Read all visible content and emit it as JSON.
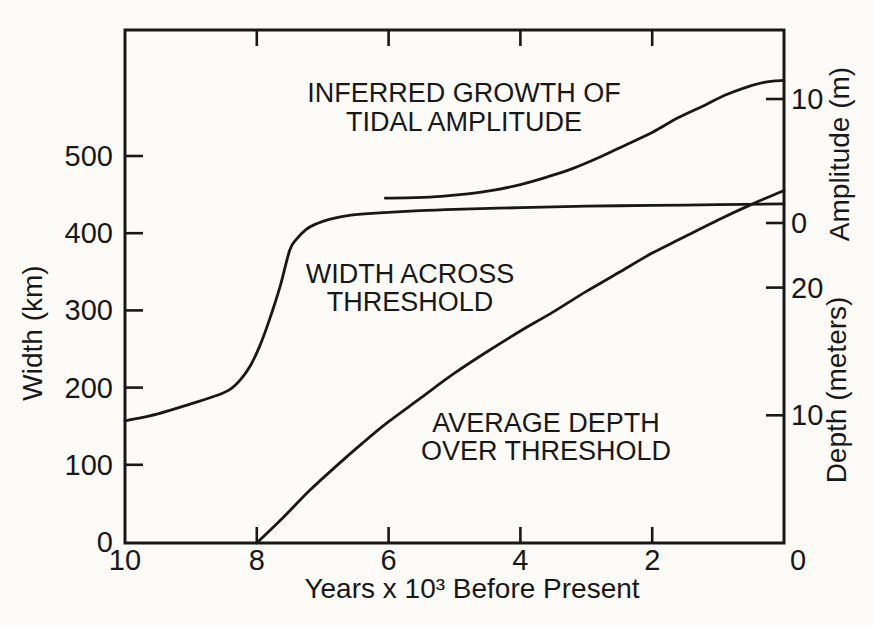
{
  "figure": {
    "background_color": "#fcfbf8",
    "ink_color": "#181818",
    "grid": false,
    "legend": "none"
  },
  "chart_data": {
    "type": "line",
    "title": "",
    "x_axis": {
      "label": "Years x 10³ Before Present",
      "ticks": [
        10,
        8,
        6,
        4,
        2,
        0
      ],
      "range": [
        10,
        0
      ],
      "direction": "reversed"
    },
    "y_left": {
      "label": "Width (km)",
      "ticks": [
        0,
        100,
        200,
        300,
        400,
        500
      ],
      "ylim": [
        0,
        660
      ]
    },
    "y_right_amplitude": {
      "label": "Amplitude (m)",
      "ticks": [
        10,
        0
      ]
    },
    "y_right_depth": {
      "label": "Depth (meters)",
      "ticks": [
        20,
        10
      ],
      "ylim_visible": [
        0,
        27.6
      ]
    },
    "series": [
      {
        "name": "width-across-threshold",
        "axis": "width",
        "label_lines": [
          "WIDTH ACROSS",
          "THRESHOLD"
        ],
        "points": [
          [
            10,
            157
          ],
          [
            9.5,
            166
          ],
          [
            9.0,
            179
          ],
          [
            8.6,
            190
          ],
          [
            8.4,
            198
          ],
          [
            8.25,
            210
          ],
          [
            8.1,
            228
          ],
          [
            7.95,
            255
          ],
          [
            7.8,
            290
          ],
          [
            7.65,
            330
          ],
          [
            7.5,
            378
          ],
          [
            7.4,
            392
          ],
          [
            7.25,
            405
          ],
          [
            7.1,
            412
          ],
          [
            6.9,
            418
          ],
          [
            6.6,
            423
          ],
          [
            6.2,
            426
          ],
          [
            5.6,
            429
          ],
          [
            5.0,
            431
          ],
          [
            4.0,
            433
          ],
          [
            3.0,
            435
          ],
          [
            2.0,
            436
          ],
          [
            1.0,
            437
          ],
          [
            0,
            438
          ]
        ]
      },
      {
        "name": "inferred-growth-of-tidal-amplitude",
        "axis": "amplitude",
        "label_lines": [
          "INFERRED GROWTH OF",
          "TIDAL AMPLITUDE"
        ],
        "points": [
          [
            6.05,
            2.0
          ],
          [
            5.6,
            2.05
          ],
          [
            5.2,
            2.15
          ],
          [
            4.8,
            2.35
          ],
          [
            4.4,
            2.65
          ],
          [
            4.0,
            3.1
          ],
          [
            3.6,
            3.7
          ],
          [
            3.2,
            4.4
          ],
          [
            2.8,
            5.3
          ],
          [
            2.4,
            6.3
          ],
          [
            2.0,
            7.3
          ],
          [
            1.6,
            8.5
          ],
          [
            1.2,
            9.5
          ],
          [
            0.9,
            10.3
          ],
          [
            0.6,
            10.9
          ],
          [
            0.3,
            11.35
          ],
          [
            0,
            11.5
          ]
        ]
      },
      {
        "name": "average-depth-over-threshold",
        "axis": "depth",
        "label_lines": [
          "AVERAGE DEPTH",
          "OVER THRESHOLD"
        ],
        "points": [
          [
            8,
            0
          ],
          [
            7.6,
            2.0
          ],
          [
            7.2,
            4.1
          ],
          [
            6.8,
            6.0
          ],
          [
            6.4,
            7.8
          ],
          [
            6.0,
            9.5
          ],
          [
            5.5,
            11.4
          ],
          [
            5.0,
            13.3
          ],
          [
            4.5,
            15.0
          ],
          [
            4.0,
            16.6
          ],
          [
            3.5,
            18.1
          ],
          [
            3.0,
            19.7
          ],
          [
            2.5,
            21.2
          ],
          [
            2.0,
            22.7
          ],
          [
            1.5,
            24.0
          ],
          [
            1.0,
            25.3
          ],
          [
            0.5,
            26.5
          ],
          [
            0,
            27.6
          ]
        ]
      }
    ]
  }
}
